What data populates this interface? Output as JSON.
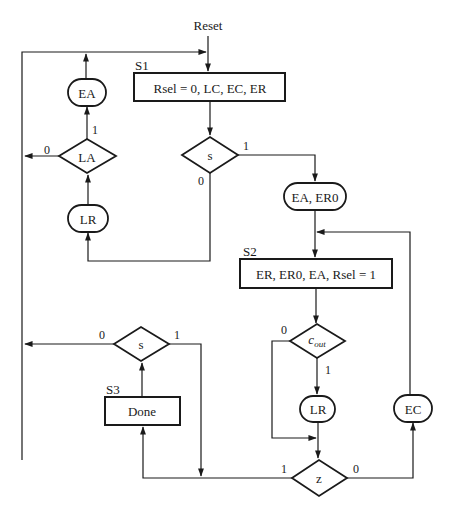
{
  "diagram": {
    "type": "flowchart",
    "entry": "Reset",
    "states": {
      "s1": {
        "label": "S1",
        "action": "Rsel = 0, LC, EC, ER"
      },
      "s2": {
        "label": "S2",
        "action": "ER, ER0, EA, Rsel = 1"
      },
      "s3": {
        "label": "S3",
        "action": "Done"
      }
    },
    "decisions": {
      "s_top": {
        "condition": "s",
        "true_label": "1",
        "false_label": "0"
      },
      "la": {
        "condition": "LA",
        "true_label": "1",
        "false_label": "0"
      },
      "cout": {
        "condition": "c",
        "subscript": "out",
        "true_label": "1",
        "false_label": "0"
      },
      "z": {
        "condition": "z",
        "true_label": "1",
        "false_label": "0"
      },
      "s_bottom": {
        "condition": "s",
        "true_label": "1",
        "false_label": "0"
      }
    },
    "conditional_outputs": {
      "ea_er0": "EA, ER0",
      "ea_left": "EA",
      "lr_left": "LR",
      "lr_right": "LR",
      "ec": "EC"
    }
  },
  "colors": {
    "line": "#1a1a1a",
    "background": "#ffffff"
  }
}
